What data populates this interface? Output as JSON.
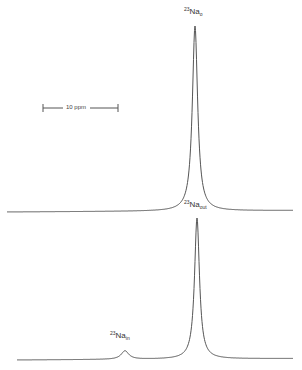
{
  "chart_data": [
    {
      "type": "line",
      "title": "",
      "description": "23Na NMR spectrum (upper trace) showing single extracellular sodium resonance",
      "peaks": [
        {
          "label_mass": "23",
          "label_element": "Na",
          "label_sub": "o",
          "position_px": 195,
          "relative_height": 1.0
        }
      ],
      "baseline_y_px": 212,
      "apex_y_px": 27,
      "x_range_px": [
        7,
        293
      ],
      "grid": false,
      "legend": false
    },
    {
      "type": "line",
      "title": "",
      "description": "23Na NMR spectrum (lower trace) with shift reagent separating intra- and extracellular sodium",
      "peaks": [
        {
          "label_mass": "23",
          "label_element": "Na",
          "label_sub": "out",
          "position_px": 197,
          "relative_height": 1.0
        },
        {
          "label_mass": "23",
          "label_element": "Na",
          "label_sub": "in",
          "position_px": 125,
          "relative_height": 0.06
        }
      ],
      "baseline_y_px": 360,
      "apex_y_px": 219,
      "x_range_px": [
        17,
        293
      ],
      "grid": false,
      "legend": false
    }
  ],
  "scale_bar": {
    "value": "10",
    "unit": "ppm",
    "text": "10 ppm"
  },
  "labels": {
    "top_peak": {
      "mass": "23",
      "element": "Na",
      "sub": "o"
    },
    "out_peak": {
      "mass": "23",
      "element": "Na",
      "sub": "out"
    },
    "in_peak": {
      "mass": "23",
      "element": "Na",
      "sub": "in"
    }
  },
  "colors": {
    "trace": "#555555",
    "background": "#ffffff"
  }
}
